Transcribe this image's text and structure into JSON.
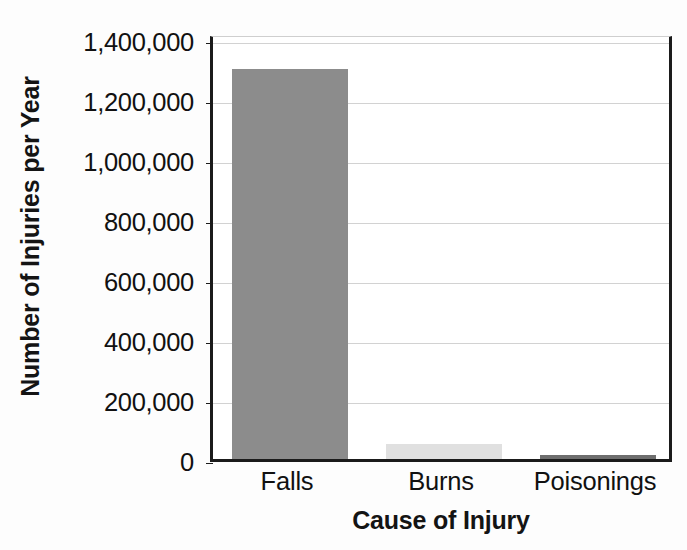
{
  "chart_data": {
    "type": "bar",
    "title": "",
    "subtitle": "",
    "xlabel": "Cause of Injury",
    "ylabel": "Number of Injuries per Year",
    "categories": [
      "Falls",
      "Burns",
      "Poisonings"
    ],
    "values": [
      1300000,
      50000,
      13000
    ],
    "series": [
      {
        "name": "Number of Injuries per Year",
        "values": [
          1300000,
          50000,
          13000
        ]
      }
    ],
    "ylim": [
      0,
      1420000
    ],
    "ytick_values": [
      0,
      200000,
      400000,
      600000,
      800000,
      1000000,
      1200000,
      1400000
    ],
    "ytick_labels": [
      "1,400,000",
      "1,200,000",
      "1,000,000",
      "800,000",
      "600,000",
      "400,000",
      "200,000",
      "0"
    ],
    "grid": true,
    "grid_axis": "y",
    "legend": false,
    "legend_position": "none",
    "bar_colors": [
      "#8c8c8c",
      "#e0e0e0",
      "#6e6e6e"
    ],
    "annotations": []
  },
  "axes": {
    "y_title": "Number of Injuries per Year",
    "x_title": "Cause of Injury"
  },
  "colors": {
    "axis": "#1b1b1b",
    "grid": "#d2d2d2",
    "text": "#111111",
    "background": "#ffffff",
    "falls_bar": "#8c8c8c",
    "burns_bar": "#e0e0e0",
    "poisonings_bar": "#6e6e6e"
  }
}
